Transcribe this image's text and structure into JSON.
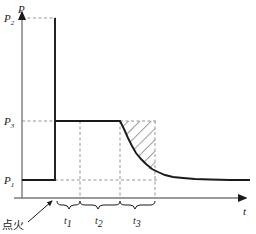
{
  "figure": {
    "type": "diagram",
    "background_color": "#ffffff",
    "ink_color": "#1a1a1a",
    "axis_color": "#7a7a7a",
    "dash_color": "#8a8a8a"
  },
  "axes": {
    "y": {
      "label": "P",
      "label_x": 20,
      "label_y": 13,
      "axis_x": 22,
      "top_y": 8,
      "bottom_y": 198,
      "arrow": true
    },
    "x": {
      "label": "t",
      "label_x": 243,
      "label_y": 214,
      "axis_y": 198,
      "left_x": 14,
      "right_x": 250,
      "arrow": true
    }
  },
  "levels": [
    {
      "name": "P2",
      "label": "P",
      "sub": "2",
      "y": 18,
      "label_x": 6,
      "label_y": 22,
      "dash_from_x": 22,
      "dash_to_x": 55
    },
    {
      "name": "P3",
      "label": "P",
      "sub": "3",
      "y": 121,
      "label_x": 6,
      "label_y": 125,
      "dash_from_x": 22,
      "dash_to_x": 55
    },
    {
      "name": "P1",
      "label": "P",
      "sub": "1",
      "y": 180,
      "label_x": 6,
      "label_y": 184,
      "dash_from_x": 22,
      "dash_to_x": 158
    }
  ],
  "curve": {
    "initial_level": "P1",
    "peak_level": "P2",
    "plateau_level": "P3",
    "tail_level": "P1",
    "ignition_x": 55,
    "plateau_end_x": 120,
    "decay_end_x": 250,
    "path": "M 22 180 L 55 180 L 55 18 L 55 121 L 120 121 L 124 129 L 128 138 L 132 146 L 136 153 L 141 159 L 146 164 L 152 169 L 158 172 L 165 175 L 173 177 L 183 178 L 195 179 L 210 179.5 L 230 180 L 250 180"
  },
  "dashed_verticals": [
    {
      "name": "t1-end",
      "x": 80,
      "from_y": 121,
      "to_y": 198
    },
    {
      "name": "t2-end",
      "x": 120,
      "from_y": 121,
      "to_y": 198
    },
    {
      "name": "t3-end",
      "x": 155,
      "from_y": 121,
      "to_y": 198
    }
  ],
  "dashed_horizontals": [
    {
      "name": "P3-plateau-extension",
      "y": 121,
      "from_x": 120,
      "to_x": 158
    }
  ],
  "hatched_region": {
    "name": "impulse-after-burnout",
    "left_boundary": "decay-curve",
    "right_x": 155,
    "top_y": 121,
    "bottom_y": 180,
    "hatch_angle_deg": 45,
    "hatch_spacing_px": 6
  },
  "segments": [
    {
      "name": "t1",
      "label": "t",
      "sub": "1",
      "from_x": 57,
      "to_x": 80,
      "label_x": 66,
      "label_y": 224
    },
    {
      "name": "t2",
      "label": "t",
      "sub": "2",
      "from_x": 80,
      "to_x": 120,
      "label_x": 96,
      "label_y": 224
    },
    {
      "name": "t3",
      "label": "t",
      "sub": "3",
      "from_x": 120,
      "to_x": 155,
      "label_x": 135,
      "label_y": 224
    }
  ],
  "brace_y": 201,
  "brace_depth": 5,
  "annotation": {
    "name": "ignition",
    "text": "点火",
    "text_x": 4,
    "text_y": 226,
    "arrow_from_x": 30,
    "arrow_from_y": 220,
    "arrow_to_x": 54,
    "arrow_to_y": 200
  }
}
